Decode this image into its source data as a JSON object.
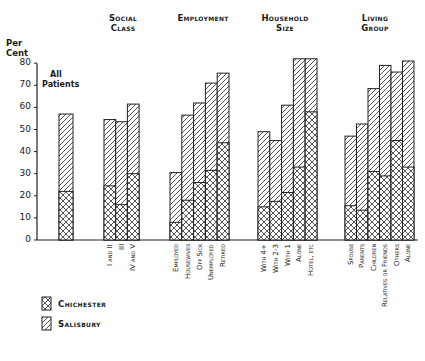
{
  "chart_data": {
    "type": "bar",
    "stacked": true,
    "title": "",
    "ylabel": "Per Cent",
    "xlabel": "",
    "ylim": [
      0,
      80
    ],
    "yticks": [
      0,
      10,
      20,
      30,
      40,
      50,
      60,
      70,
      80
    ],
    "grid": false,
    "legend_position": "bottom-left",
    "legend": [
      {
        "name": "Chichester",
        "pattern": "cross-hatch"
      },
      {
        "name": "Salisbury",
        "pattern": "diagonal-hatch"
      }
    ],
    "note": "Each bar total height is the Salisbury value; lower cross-hatched segment is the Chichester value.",
    "groups": [
      {
        "name": "All Patients",
        "categories": [
          ""
        ],
        "chichester": [
          22
        ],
        "salisbury": [
          57
        ]
      },
      {
        "name": "Social Class",
        "categories": [
          "I and II",
          "III",
          "IV and V"
        ],
        "chichester": [
          24.5,
          16,
          30
        ],
        "salisbury": [
          54.5,
          53.5,
          61.5
        ]
      },
      {
        "name": "Employment",
        "categories": [
          "Employed",
          "Housewives",
          "Off Sick",
          "Unemployed",
          "Retired"
        ],
        "chichester": [
          8,
          18,
          26,
          31.5,
          44
        ],
        "salisbury": [
          30.5,
          56.5,
          62,
          71,
          75.5
        ]
      },
      {
        "name": "Household Size",
        "categories": [
          "With 4+",
          "With 2-3",
          "With 1",
          "Alone",
          "Hotel, etc"
        ],
        "chichester": [
          15,
          17.5,
          21.5,
          33,
          58
        ],
        "salisbury": [
          49,
          45,
          61,
          82,
          82
        ]
      },
      {
        "name": "Living Group",
        "categories": [
          "Spouse",
          "Parents",
          "Children",
          "Relatives or Friends",
          "Others",
          "Alone"
        ],
        "chichester": [
          15.5,
          13.5,
          31,
          29,
          45,
          33
        ],
        "salisbury": [
          47,
          52.5,
          68.5,
          79,
          76,
          81
        ]
      }
    ]
  },
  "labels": {
    "ylabel_line1": "Per",
    "ylabel_line2": "Cent",
    "all_patients_line1": "All",
    "all_patients_line2": "Patients",
    "head_social_1": "Social",
    "head_social_2": "Class",
    "head_employment": "Employment",
    "head_household_1": "Household",
    "head_household_2": "Size",
    "head_living_1": "Living",
    "head_living_2": "Group",
    "legend_chichester": "Chichester",
    "legend_salisbury": "Salisbury"
  }
}
